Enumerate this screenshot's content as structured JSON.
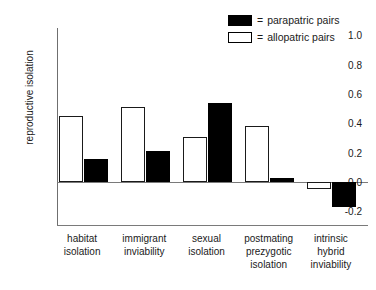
{
  "chart_data": {
    "type": "bar",
    "title": "",
    "xlabel": "",
    "ylabel": "reproductive isolation",
    "ylim": [
      -0.3,
      1.05
    ],
    "yticks": [
      1.0,
      0.8,
      0.6,
      0.4,
      0.2,
      0.0,
      -0.2
    ],
    "ytick_labels": [
      "1.0",
      "0.8",
      "0.6",
      "0.4",
      "0.2",
      "0.0",
      "-0.2"
    ],
    "grid": false,
    "legend_position": "top-right",
    "categories": [
      "habitat isolation",
      "immigrant inviability",
      "sexual isolation",
      "postmating prezygotic isolation",
      "intrinsic hybrid inviability"
    ],
    "category_lines": [
      [
        "habitat",
        "isolation"
      ],
      [
        "immigrant",
        "inviability"
      ],
      [
        "sexual",
        "isolation"
      ],
      [
        "postmating",
        "prezygotic",
        "isolation"
      ],
      [
        "intrinsic",
        "hybrid",
        "inviability"
      ]
    ],
    "series": [
      {
        "name": "allopatric pairs",
        "color": "#ffffff",
        "edge_color": "#1a1a1a",
        "values": [
          0.45,
          0.51,
          0.31,
          0.38,
          -0.05
        ]
      },
      {
        "name": "parapatric pairs",
        "color": "#000000",
        "edge_color": "#000000",
        "values": [
          0.16,
          0.21,
          0.54,
          0.03,
          -0.17
        ]
      }
    ]
  },
  "legend": {
    "entries": [
      {
        "equals": "=",
        "label": "parapatric pairs",
        "swatch": "filled"
      },
      {
        "equals": "=",
        "label": "allopatric pairs",
        "swatch": "hollow"
      }
    ]
  },
  "axis": {
    "ylabel": "reproductive isolation",
    "ytick_labels": [
      "1.0",
      "0.8",
      "0.6",
      "0.4",
      "0.2",
      "0.0",
      "-0.2"
    ]
  }
}
